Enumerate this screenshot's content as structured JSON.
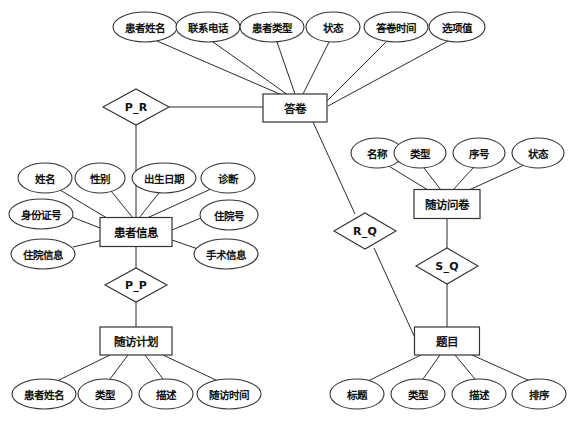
{
  "diagram": {
    "type": "entity-relationship-diagram",
    "title": "",
    "language": "zh-CN",
    "colors": {
      "background": "#ffffff",
      "stroke": "#333333",
      "edge": "#2b2b2b",
      "text": "#111111"
    }
  },
  "entities": [
    {
      "id": "answer_sheet",
      "label": "答卷",
      "x": 295,
      "y": 108,
      "w": 64,
      "h": 28
    },
    {
      "id": "patient_info",
      "label": "患者信息",
      "x": 136,
      "y": 232,
      "w": 72,
      "h": 29
    },
    {
      "id": "followup_plan",
      "label": "随访计划",
      "x": 136,
      "y": 341,
      "w": 72,
      "h": 28
    },
    {
      "id": "questionnaire",
      "label": "随访问卷",
      "x": 447,
      "y": 204,
      "w": 66,
      "h": 29
    },
    {
      "id": "question",
      "label": "题目",
      "x": 447,
      "y": 341,
      "w": 65,
      "h": 28
    }
  ],
  "relationships": [
    {
      "id": "p_r",
      "label": "P_R",
      "x": 136,
      "y": 107,
      "rx": 33,
      "ry": 18
    },
    {
      "id": "p_p",
      "label": "P_P",
      "x": 136,
      "y": 285,
      "rx": 31,
      "ry": 17
    },
    {
      "id": "r_q",
      "label": "R_Q",
      "x": 365,
      "y": 231,
      "rx": 31,
      "ry": 18
    },
    {
      "id": "s_q",
      "label": "S_Q",
      "x": 447,
      "y": 266,
      "rx": 31,
      "ry": 18
    }
  ],
  "attributes": [
    {
      "id": "as_patient_name",
      "label": "患者姓名",
      "owner": "answer_sheet",
      "x": 145,
      "y": 27,
      "rx": 32,
      "ry": 15
    },
    {
      "id": "as_phone",
      "label": "联系电话",
      "owner": "answer_sheet",
      "x": 208,
      "y": 27,
      "rx": 32,
      "ry": 15
    },
    {
      "id": "as_patient_type",
      "label": "患者类型",
      "owner": "answer_sheet",
      "x": 272,
      "y": 27,
      "rx": 32,
      "ry": 15
    },
    {
      "id": "as_status",
      "label": "状态",
      "owner": "answer_sheet",
      "x": 333,
      "y": 27,
      "rx": 27,
      "ry": 15
    },
    {
      "id": "as_answer_time",
      "label": "答卷时间",
      "owner": "answer_sheet",
      "x": 396,
      "y": 27,
      "rx": 32,
      "ry": 15
    },
    {
      "id": "as_option_value",
      "label": "选项值",
      "owner": "answer_sheet",
      "x": 457,
      "y": 27,
      "rx": 28,
      "ry": 15
    },
    {
      "id": "pi_name",
      "label": "姓名",
      "owner": "patient_info",
      "x": 45,
      "y": 178,
      "rx": 27,
      "ry": 15
    },
    {
      "id": "pi_gender",
      "label": "性别",
      "owner": "patient_info",
      "x": 100,
      "y": 178,
      "rx": 25,
      "ry": 15
    },
    {
      "id": "pi_birthday",
      "label": "出生日期",
      "owner": "patient_info",
      "x": 164,
      "y": 178,
      "rx": 32,
      "ry": 15
    },
    {
      "id": "pi_diagnosis",
      "label": "诊断",
      "owner": "patient_info",
      "x": 228,
      "y": 178,
      "rx": 27,
      "ry": 15
    },
    {
      "id": "pi_id_card",
      "label": "身份证号",
      "owner": "patient_info",
      "x": 41,
      "y": 214,
      "rx": 32,
      "ry": 15
    },
    {
      "id": "pi_ward_no",
      "label": "住院号",
      "owner": "patient_info",
      "x": 229,
      "y": 215,
      "rx": 29,
      "ry": 15
    },
    {
      "id": "pi_ward_info",
      "label": "住院信息",
      "owner": "patient_info",
      "x": 43,
      "y": 254,
      "rx": 32,
      "ry": 15
    },
    {
      "id": "pi_surgery",
      "label": "手术信息",
      "owner": "patient_info",
      "x": 226,
      "y": 254,
      "rx": 32,
      "ry": 15
    },
    {
      "id": "fp_patient_name",
      "label": "患者姓名",
      "owner": "followup_plan",
      "x": 44,
      "y": 394,
      "rx": 32,
      "ry": 15
    },
    {
      "id": "fp_type",
      "label": "类型",
      "owner": "followup_plan",
      "x": 105,
      "y": 394,
      "rx": 27,
      "ry": 15
    },
    {
      "id": "fp_description",
      "label": "描述",
      "owner": "followup_plan",
      "x": 166,
      "y": 394,
      "rx": 27,
      "ry": 15
    },
    {
      "id": "fp_followup_time",
      "label": "随访时间",
      "owner": "followup_plan",
      "x": 229,
      "y": 394,
      "rx": 32,
      "ry": 15
    },
    {
      "id": "q_name",
      "label": "名称",
      "owner": "questionnaire",
      "x": 377,
      "y": 153,
      "rx": 26,
      "ry": 15
    },
    {
      "id": "q_type",
      "label": "类型",
      "owner": "questionnaire",
      "x": 420,
      "y": 153,
      "rx": 26,
      "ry": 15
    },
    {
      "id": "q_seq",
      "label": "序号",
      "owner": "questionnaire",
      "x": 479,
      "y": 153,
      "rx": 26,
      "ry": 15
    },
    {
      "id": "q_status",
      "label": "状态",
      "owner": "questionnaire",
      "x": 538,
      "y": 153,
      "rx": 26,
      "ry": 15
    },
    {
      "id": "qt_title",
      "label": "标题",
      "owner": "question",
      "x": 357,
      "y": 394,
      "rx": 27,
      "ry": 15
    },
    {
      "id": "qt_type",
      "label": "类型",
      "owner": "question",
      "x": 418,
      "y": 394,
      "rx": 27,
      "ry": 15
    },
    {
      "id": "qt_description",
      "label": "描述",
      "owner": "question",
      "x": 479,
      "y": 394,
      "rx": 27,
      "ry": 15
    },
    {
      "id": "qt_order",
      "label": "排序",
      "owner": "question",
      "x": 539,
      "y": 394,
      "rx": 27,
      "ry": 15
    }
  ],
  "edges": [
    {
      "id": "e-as-name",
      "from": "as_patient_name",
      "to": "answer_sheet",
      "x1": 157,
      "y1": 41,
      "x2": 282,
      "y2": 95
    },
    {
      "id": "e-as-phone",
      "from": "as_phone",
      "to": "answer_sheet",
      "x1": 213,
      "y1": 42,
      "x2": 288,
      "y2": 95
    },
    {
      "id": "e-as-ptype",
      "from": "as_patient_type",
      "to": "answer_sheet",
      "x1": 277,
      "y1": 42,
      "x2": 295,
      "y2": 94
    },
    {
      "id": "e-as-status",
      "from": "as_status",
      "to": "answer_sheet",
      "x1": 329,
      "y1": 42,
      "x2": 303,
      "y2": 94
    },
    {
      "id": "e-as-time",
      "from": "as_answer_time",
      "to": "answer_sheet",
      "x1": 386,
      "y1": 42,
      "x2": 327,
      "y2": 101
    },
    {
      "id": "e-as-option",
      "from": "as_option_value",
      "to": "answer_sheet",
      "x1": 448,
      "y1": 41,
      "x2": 328,
      "y2": 106
    },
    {
      "id": "e-pr-as",
      "from": "p_r",
      "to": "answer_sheet",
      "x1": 169,
      "y1": 107,
      "x2": 263,
      "y2": 107
    },
    {
      "id": "e-pr-pi",
      "from": "p_r",
      "to": "patient_info",
      "x1": 136,
      "y1": 125,
      "x2": 136,
      "y2": 218
    },
    {
      "id": "e-as-rq",
      "from": "answer_sheet",
      "to": "r_q",
      "x1": 313,
      "y1": 122,
      "x2": 355,
      "y2": 214
    },
    {
      "id": "e-rq-qt",
      "from": "r_q",
      "to": "question",
      "x1": 374,
      "y1": 248,
      "x2": 416,
      "y2": 340
    },
    {
      "id": "e-pi-name",
      "from": "pi_name",
      "to": "patient_info",
      "x1": 60,
      "y1": 190,
      "x2": 122,
      "y2": 227
    },
    {
      "id": "e-pi-gender",
      "from": "pi_gender",
      "to": "patient_info",
      "x1": 111,
      "y1": 191,
      "x2": 133,
      "y2": 218
    },
    {
      "id": "e-pi-birth",
      "from": "pi_birthday",
      "to": "patient_info",
      "x1": 159,
      "y1": 193,
      "x2": 139,
      "y2": 218
    },
    {
      "id": "e-pi-diag",
      "from": "pi_diagnosis",
      "to": "patient_info",
      "x1": 211,
      "y1": 189,
      "x2": 147,
      "y2": 218
    },
    {
      "id": "e-pi-idcard",
      "from": "pi_id_card",
      "to": "patient_info",
      "x1": 72,
      "y1": 217,
      "x2": 100,
      "y2": 228
    },
    {
      "id": "e-pi-ward",
      "from": "pi_ward_no",
      "to": "patient_info",
      "x1": 201,
      "y1": 218,
      "x2": 172,
      "y2": 230
    },
    {
      "id": "e-pi-winfo",
      "from": "pi_ward_info",
      "to": "patient_info",
      "x1": 73,
      "y1": 247,
      "x2": 103,
      "y2": 240
    },
    {
      "id": "e-pi-surg",
      "from": "pi_surgery",
      "to": "patient_info",
      "x1": 198,
      "y1": 249,
      "x2": 172,
      "y2": 240
    },
    {
      "id": "e-pi-pp",
      "from": "patient_info",
      "to": "p_p",
      "x1": 136,
      "y1": 247,
      "x2": 136,
      "y2": 268
    },
    {
      "id": "e-pp-fp",
      "from": "p_p",
      "to": "followup_plan",
      "x1": 136,
      "y1": 302,
      "x2": 136,
      "y2": 327
    },
    {
      "id": "e-fp-pname",
      "from": "fp_patient_name",
      "to": "followup_plan",
      "x1": 57,
      "y1": 381,
      "x2": 110,
      "y2": 355
    },
    {
      "id": "e-fp-type",
      "from": "fp_type",
      "to": "followup_plan",
      "x1": 110,
      "y1": 379,
      "x2": 128,
      "y2": 355
    },
    {
      "id": "e-fp-desc",
      "from": "fp_description",
      "to": "followup_plan",
      "x1": 163,
      "y1": 379,
      "x2": 145,
      "y2": 355
    },
    {
      "id": "e-fp-time",
      "from": "fp_followup_time",
      "to": "followup_plan",
      "x1": 218,
      "y1": 381,
      "x2": 163,
      "y2": 355
    },
    {
      "id": "e-q-name",
      "from": "q_name",
      "to": "questionnaire",
      "x1": 387,
      "y1": 165,
      "x2": 428,
      "y2": 190
    },
    {
      "id": "e-q-type",
      "from": "q_type",
      "to": "questionnaire",
      "x1": 424,
      "y1": 168,
      "x2": 441,
      "y2": 190
    },
    {
      "id": "e-q-seq",
      "from": "q_seq",
      "to": "questionnaire",
      "x1": 473,
      "y1": 168,
      "x2": 453,
      "y2": 190
    },
    {
      "id": "e-q-status",
      "from": "q_status",
      "to": "questionnaire",
      "x1": 524,
      "y1": 165,
      "x2": 469,
      "y2": 190
    },
    {
      "id": "e-qn-sq",
      "from": "questionnaire",
      "to": "s_q",
      "x1": 447,
      "y1": 219,
      "x2": 447,
      "y2": 248
    },
    {
      "id": "e-sq-qt",
      "from": "s_q",
      "to": "question",
      "x1": 447,
      "y1": 284,
      "x2": 447,
      "y2": 327
    },
    {
      "id": "e-qt-title",
      "from": "qt_title",
      "to": "question",
      "x1": 368,
      "y1": 381,
      "x2": 421,
      "y2": 355
    },
    {
      "id": "e-qt-type",
      "from": "qt_type",
      "to": "question",
      "x1": 423,
      "y1": 379,
      "x2": 440,
      "y2": 355
    },
    {
      "id": "e-qt-desc",
      "from": "qt_description",
      "to": "question",
      "x1": 475,
      "y1": 379,
      "x2": 455,
      "y2": 355
    },
    {
      "id": "e-qt-order",
      "from": "qt_order",
      "to": "question",
      "x1": 530,
      "y1": 381,
      "x2": 472,
      "y2": 355
    }
  ]
}
